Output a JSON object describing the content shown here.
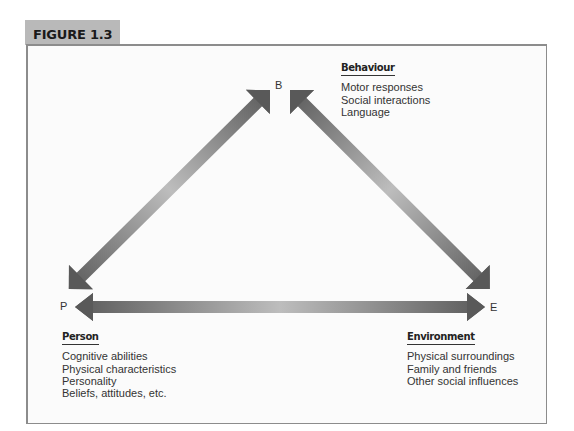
{
  "figure": {
    "label": "FIGURE 1.3"
  },
  "nodes": {
    "behaviour": {
      "letter": "B"
    },
    "person": {
      "letter": "P"
    },
    "environment": {
      "letter": "E"
    }
  },
  "groups": {
    "behaviour": {
      "heading": "Behaviour",
      "items": [
        "Motor responses",
        "Social interactions",
        "Language"
      ]
    },
    "person": {
      "heading": "Person",
      "items": [
        "Cognitive abilities",
        "Physical characteristics",
        "Personality",
        "Beliefs, attitudes, etc."
      ]
    },
    "environment": {
      "heading": "Environment",
      "items": [
        "Physical surroundings",
        "Family and friends",
        "Other social influences"
      ]
    }
  },
  "arrows": [
    {
      "from": "B",
      "to": "P",
      "type": "bidirectional"
    },
    {
      "from": "B",
      "to": "E",
      "type": "bidirectional"
    },
    {
      "from": "P",
      "to": "E",
      "type": "bidirectional"
    }
  ],
  "colors": {
    "arrow_dark": "#5e5e5e",
    "arrow_light": "#c4c4c4",
    "tab_bg": "#b9b9b9",
    "border": "#8c8c8c"
  }
}
